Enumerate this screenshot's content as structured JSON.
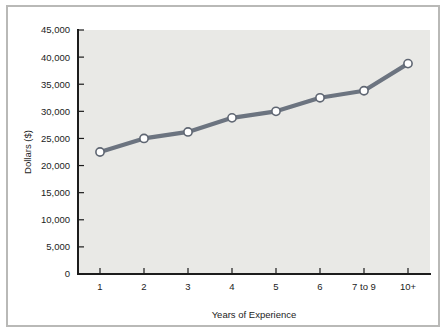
{
  "chart_data": {
    "type": "line",
    "title": "",
    "subtitle": "",
    "xlabel": "Years of Experience",
    "ylabel": "Dollars ($)",
    "categories": [
      "1",
      "2",
      "3",
      "4",
      "5",
      "6",
      "7 to 9",
      "10+"
    ],
    "values": [
      22500,
      25000,
      26200,
      28800,
      30000,
      32500,
      33800,
      38800
    ],
    "series": [
      {
        "name": "Salary",
        "values": [
          22500,
          25000,
          26200,
          28800,
          30000,
          32500,
          33800,
          38800
        ]
      }
    ],
    "ylim": [
      0,
      45000
    ],
    "yticks": [
      0,
      5000,
      10000,
      15000,
      20000,
      25000,
      30000,
      35000,
      40000,
      45000
    ],
    "ytick_labels": [
      "0",
      "5,000",
      "10,000",
      "15,000",
      "20,000",
      "25,000",
      "30,000",
      "35,000",
      "40,000",
      "45,000"
    ],
    "xtick_labels": [
      "1",
      "2",
      "3",
      "4",
      "5",
      "6",
      "7 to 9",
      "10+"
    ],
    "grid": false,
    "legend_position": "none",
    "colors": {
      "line": "#6c7480",
      "marker_fill": "#ffffff",
      "marker_stroke": "#5f6672",
      "plot_background": "#e9e9e6",
      "axis": "#1c1c1c",
      "frame": "#b9b9b7",
      "text": "#1c1c1c"
    }
  },
  "axes": {
    "y_axis_title": "Dollars ($)",
    "x_axis_title": "Years of Experience"
  }
}
